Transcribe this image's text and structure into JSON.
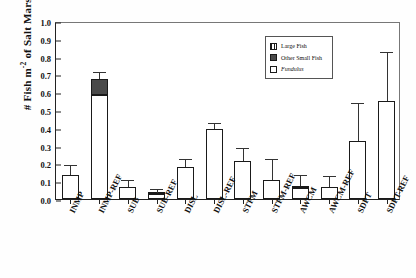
{
  "chart_data": {
    "type": "bar",
    "title": "",
    "xlabel": "",
    "ylabel": "# Fish m-2 of Salt Marsh",
    "ylabel_parts": {
      "prefix": "# Fish m",
      "exponent": "-2",
      "suffix": " of Salt Marsh"
    },
    "ylim": [
      0.0,
      1.0
    ],
    "ytick_labels": [
      "0.0",
      "0.1",
      "0.2",
      "0.3",
      "0.4",
      "0.5",
      "0.6",
      "0.7",
      "0.8",
      "0.9",
      "1.0"
    ],
    "ytick_values": [
      0.0,
      0.1,
      0.2,
      0.3,
      0.4,
      0.5,
      0.6,
      0.7,
      0.8,
      0.9,
      1.0
    ],
    "grid": false,
    "stacked": true,
    "legend_position": "top-right",
    "categories": [
      "INMP",
      "INMP-REF",
      "SUB",
      "SUB-REF",
      "DISL",
      "DISL-REF",
      "STFM",
      "STFM-REF",
      "AWCM",
      "AWCM-REF",
      "SDPT",
      "SDPT-REF"
    ],
    "series": [
      {
        "name": "Fundulus",
        "color": "#ffffff",
        "values": [
          0.135,
          0.585,
          0.065,
          0.027,
          0.18,
          0.395,
          0.215,
          0.105,
          0.062,
          0.07,
          0.325,
          0.55
        ]
      },
      {
        "name": "Other Small Fish",
        "color": "#4a4a4a",
        "values": [
          0.0,
          0.09,
          0.0,
          0.006,
          0.0,
          0.0,
          0.0,
          0.0,
          0.01,
          0.0,
          0.0,
          0.0
        ]
      },
      {
        "name": "Large Fish",
        "color": "#ffffff",
        "values": [
          0.0,
          0.0,
          0.0,
          0.0,
          0.0,
          0.0,
          0.0,
          0.0,
          0.0,
          0.0,
          0.0,
          0.0
        ]
      }
    ],
    "totals": [
      0.135,
      0.675,
      0.065,
      0.033,
      0.18,
      0.395,
      0.215,
      0.105,
      0.072,
      0.07,
      0.325,
      0.55
    ],
    "error_upper": [
      0.05,
      0.035,
      0.037,
      0.015,
      0.04,
      0.025,
      0.065,
      0.115,
      0.058,
      0.055,
      0.21,
      0.27
    ],
    "legend_entries": [
      {
        "label": "Large Fish",
        "italic": false,
        "swatch": "large"
      },
      {
        "label": "Other Small Fish",
        "italic": false,
        "swatch": "other"
      },
      {
        "label": "Fundulus",
        "italic": true,
        "swatch": "fund"
      }
    ]
  }
}
